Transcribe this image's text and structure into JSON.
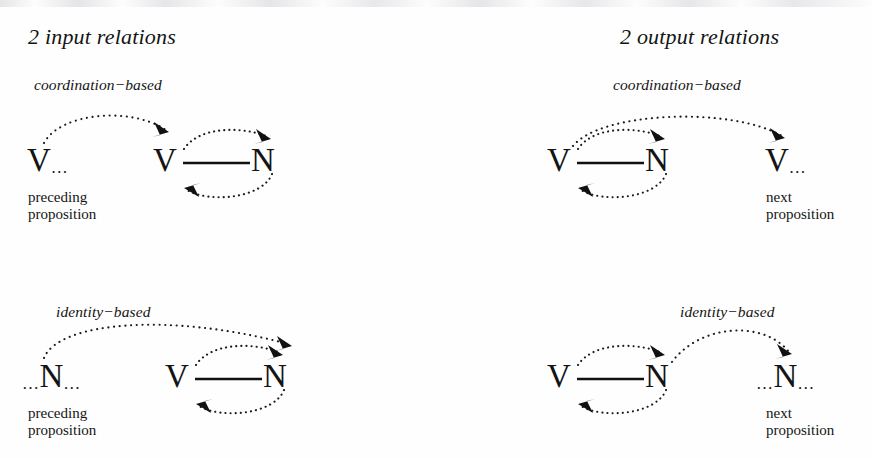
{
  "figure": {
    "panels": [
      {
        "id": "input",
        "title": "2 input relations",
        "groups": [
          {
            "id": "input-coordination",
            "label": "coordination−based",
            "context_node": "V",
            "context_node_ellipsis_before": "",
            "context_node_ellipsis_after": "…",
            "caption_line1": "preceding",
            "caption_line2": "proposition",
            "clause_left": "V",
            "clause_right": "N"
          },
          {
            "id": "input-identity",
            "label": "identity−based",
            "context_node": "N",
            "context_node_ellipsis_before": "…",
            "context_node_ellipsis_after": "…",
            "caption_line1": "preceding",
            "caption_line2": "proposition",
            "clause_left": "V",
            "clause_right": "N"
          }
        ]
      },
      {
        "id": "output",
        "title": "2 output relations",
        "groups": [
          {
            "id": "output-coordination",
            "label": "coordination−based",
            "context_node": "V",
            "context_node_ellipsis_before": "",
            "context_node_ellipsis_after": "…",
            "caption_line1": "next",
            "caption_line2": "proposition",
            "clause_left": "V",
            "clause_right": "N"
          },
          {
            "id": "output-identity",
            "label": "identity−based",
            "context_node": "N",
            "context_node_ellipsis_before": "…",
            "context_node_ellipsis_after": "…",
            "caption_line1": "next",
            "caption_line2": "proposition",
            "clause_left": "V",
            "clause_right": "N"
          }
        ]
      }
    ],
    "colors": {
      "ink": "#141414",
      "background": "#ffffff",
      "arc": "#1b1b1b"
    }
  }
}
